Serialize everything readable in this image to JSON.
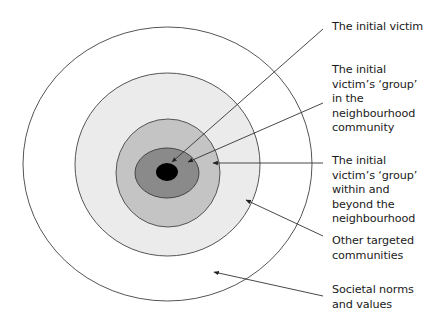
{
  "diagram": {
    "type": "concentric-circles",
    "rings": [
      {
        "name": "Societal norms and values",
        "fill": "#ffffff"
      },
      {
        "name": "Other targeted communities",
        "fill": "#ebebeb"
      },
      {
        "name": "The initial victim's 'group' within and beyond the neighbourhood",
        "fill": "#c4c4c4"
      },
      {
        "name": "The initial victim's 'group' in the neighbourhood community",
        "fill": "#8a8a8a"
      },
      {
        "name": "The initial victim",
        "fill": "#000000"
      }
    ],
    "stroke_color": "#555555"
  },
  "labels": [
    {
      "id": "initial-victim",
      "text": "The initial victim"
    },
    {
      "id": "group-neighbourhood",
      "text": "The initial\nvictim’s ‘group’\nin the\nneighbourhood\ncommunity"
    },
    {
      "id": "group-beyond",
      "text": "The initial\nvictim’s ‘group’\nwithin and\nbeyond the\nneighbourhood"
    },
    {
      "id": "other-communities",
      "text": "Other targeted\ncommunities"
    },
    {
      "id": "societal-norms",
      "text": "Societal norms\nand values"
    }
  ]
}
